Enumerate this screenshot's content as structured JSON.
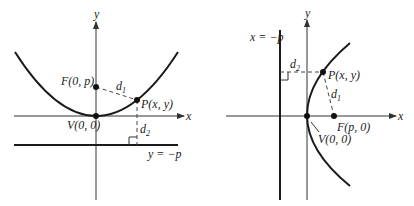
{
  "left_diagram": {
    "axis_x_label": "x",
    "axis_y_label": "y",
    "focus_label": "F(0, p)",
    "vertex_label": "V(0, 0)",
    "point_label": "P(x, y)",
    "d1_label": "d",
    "d1_sub": "1",
    "d2_label": "d",
    "d2_sub": "2",
    "directrix_label": "y = −p"
  },
  "right_diagram": {
    "axis_x_label": "x",
    "axis_y_label": "y",
    "focus_label": "F(p, 0)",
    "vertex_label": "V(0, 0)",
    "point_label": "P(x, y)",
    "d1_label": "d",
    "d1_sub": "1",
    "d2_label": "d",
    "d2_sub": "2",
    "directrix_label": "x = −p"
  },
  "colors": {
    "ink": "#1a1a1a",
    "axis": "#333333"
  }
}
